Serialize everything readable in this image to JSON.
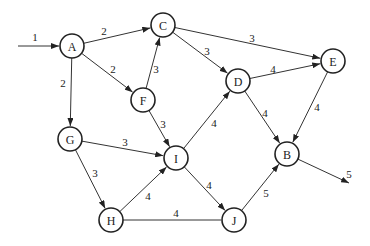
{
  "diagram": {
    "type": "directed-network-flow-graph",
    "nodes": [
      {
        "id": "A",
        "label": "A",
        "x": 72,
        "y": 46
      },
      {
        "id": "C",
        "label": "C",
        "x": 163,
        "y": 25
      },
      {
        "id": "E",
        "label": "E",
        "x": 333,
        "y": 61
      },
      {
        "id": "D",
        "label": "D",
        "x": 238,
        "y": 81
      },
      {
        "id": "F",
        "label": "F",
        "x": 143,
        "y": 100
      },
      {
        "id": "G",
        "label": "G",
        "x": 70,
        "y": 139
      },
      {
        "id": "I",
        "label": "I",
        "x": 176,
        "y": 158
      },
      {
        "id": "B",
        "label": "B",
        "x": 287,
        "y": 154
      },
      {
        "id": "H",
        "label": "H",
        "x": 111,
        "y": 220
      },
      {
        "id": "J",
        "label": "J",
        "x": 234,
        "y": 220
      }
    ],
    "edges": [
      {
        "from": "source",
        "to": "A",
        "weight": "1",
        "arrow": true,
        "sx": 18,
        "sy": 46,
        "lx": 35,
        "ly": 37
      },
      {
        "from": "A",
        "to": "C",
        "weight": "2",
        "arrow": true,
        "lx": 104,
        "ly": 31
      },
      {
        "from": "A",
        "to": "F",
        "weight": "2",
        "arrow": true,
        "lx": 113,
        "ly": 69
      },
      {
        "from": "A",
        "to": "G",
        "weight": "2",
        "arrow": true,
        "lx": 63,
        "ly": 83
      },
      {
        "from": "F",
        "to": "C",
        "weight": "3",
        "arrow": true,
        "lx": 156,
        "ly": 69
      },
      {
        "from": "C",
        "to": "E",
        "weight": "3",
        "arrow": true,
        "lx": 252,
        "ly": 38
      },
      {
        "from": "C",
        "to": "D",
        "weight": "3",
        "arrow": true,
        "lx": 207,
        "ly": 51
      },
      {
        "from": "D",
        "to": "E",
        "weight": "4",
        "arrow": true,
        "lx": 273,
        "ly": 69
      },
      {
        "from": "F",
        "to": "I",
        "weight": "3",
        "arrow": true,
        "lx": 163,
        "ly": 124
      },
      {
        "from": "I",
        "to": "D",
        "weight": "4",
        "arrow": true,
        "lx": 214,
        "ly": 123
      },
      {
        "from": "D",
        "to": "B",
        "weight": "4",
        "arrow": true,
        "lx": 265,
        "ly": 113
      },
      {
        "from": "E",
        "to": "B",
        "weight": "4",
        "arrow": true,
        "lx": 317,
        "ly": 107
      },
      {
        "from": "G",
        "to": "I",
        "weight": "3",
        "arrow": true,
        "lx": 125,
        "ly": 142
      },
      {
        "from": "G",
        "to": "H",
        "weight": "3",
        "arrow": true,
        "lx": 95,
        "ly": 173
      },
      {
        "from": "H",
        "to": "I",
        "weight": "4",
        "arrow": true,
        "lx": 148,
        "ly": 196
      },
      {
        "from": "I",
        "to": "J",
        "weight": "4",
        "arrow": true,
        "lx": 209,
        "ly": 185
      },
      {
        "from": "H",
        "to": "J",
        "weight": "4",
        "arrow": false,
        "lx": 176,
        "ly": 213
      },
      {
        "from": "J",
        "to": "B",
        "weight": "5",
        "arrow": true,
        "lx": 266,
        "ly": 193
      },
      {
        "from": "B",
        "to": "sink",
        "weight": "5",
        "arrow": true,
        "tx": 349,
        "ty": 183,
        "lx": 349,
        "ly": 174
      }
    ],
    "node_radius": 12
  }
}
